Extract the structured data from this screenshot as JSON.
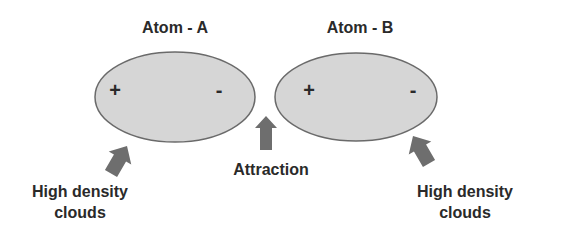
{
  "diagram": {
    "atoms": [
      {
        "id": "A",
        "title": "Atom - A",
        "positive": "+",
        "negative": "-"
      },
      {
        "id": "B",
        "title": "Atom - B",
        "positive": "+",
        "negative": "-"
      }
    ],
    "attraction_label": "Attraction",
    "left_cloud_label_line1": "High density",
    "left_cloud_label_line2": "clouds",
    "right_cloud_label_line1": "High density",
    "right_cloud_label_line2": "clouds",
    "colors": {
      "atom_fill": "#d6d6d6",
      "atom_stroke": "#6a6a6a",
      "arrow_fill": "#6e6e6e",
      "text": "#2a2a2a"
    }
  }
}
